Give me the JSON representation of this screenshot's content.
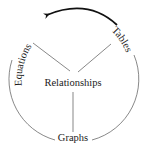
{
  "diagram": {
    "center_label": "Relationships",
    "nodes": [
      {
        "id": "equations",
        "label": "Equations",
        "position": "upper-left"
      },
      {
        "id": "tables",
        "label": "Tables",
        "position": "upper-right"
      },
      {
        "id": "graphs",
        "label": "Graphs",
        "position": "bottom"
      }
    ],
    "arrow": {
      "from": "Tables",
      "to": "Equations",
      "style": "thick-curved"
    },
    "colors": {
      "stroke": "#555555",
      "arrow": "#111111",
      "text": "#1a1a1a"
    }
  }
}
